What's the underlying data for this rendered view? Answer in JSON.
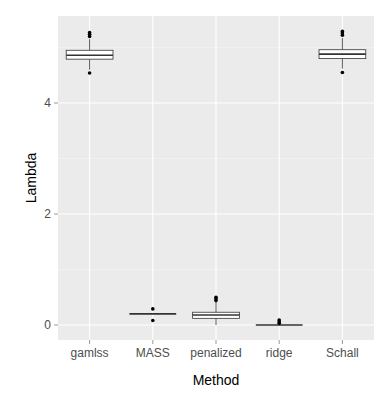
{
  "chart_data": {
    "type": "box",
    "title": "",
    "xlabel": "Method",
    "ylabel": "Lambda",
    "categories": [
      "gamlss",
      "MASS",
      "penalized",
      "ridge",
      "Schall"
    ],
    "ylim": [
      -0.27,
      5.5
    ],
    "yticks": [
      0,
      2,
      4
    ],
    "grid": true,
    "legend": "none",
    "boxes": [
      {
        "name": "gamlss",
        "whisker_low": 4.6,
        "q1": 4.79,
        "median": 4.86,
        "q3": 4.95,
        "whisker_high": 5.15,
        "outliers": [
          5.2,
          5.24,
          5.27,
          4.54
        ]
      },
      {
        "name": "MASS",
        "whisker_low": 0.2,
        "q1": 0.2,
        "median": 0.2,
        "q3": 0.2,
        "whisker_high": 0.2,
        "outliers": [
          0.29,
          0.08
        ]
      },
      {
        "name": "penalized",
        "whisker_low": 0.0,
        "q1": 0.12,
        "median": 0.18,
        "q3": 0.23,
        "whisker_high": 0.42,
        "outliers": [
          0.44,
          0.47,
          0.5
        ]
      },
      {
        "name": "ridge",
        "whisker_low": 0.0,
        "q1": 0.0,
        "median": 0.0,
        "q3": 0.0,
        "whisker_high": 0.0,
        "outliers": [
          0.03,
          0.06,
          0.09
        ]
      },
      {
        "name": "Schall",
        "whisker_low": 4.62,
        "q1": 4.8,
        "median": 4.88,
        "q3": 4.96,
        "whisker_high": 5.17,
        "outliers": [
          5.22,
          5.26,
          5.29,
          4.55
        ]
      }
    ]
  },
  "colors": {
    "panel_bg": "#ebebeb",
    "grid_major": "#ffffff",
    "grid_minor": "#f5f5f5",
    "box_fill": "#ffffff",
    "box_stroke": "#333333",
    "tick_text": "#4d4d4d"
  }
}
